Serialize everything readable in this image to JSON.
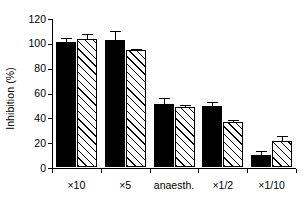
{
  "chart_data": {
    "type": "bar",
    "title": "",
    "xlabel": "",
    "ylabel": "Inhibition (%)",
    "ylim": [
      0,
      120
    ],
    "yticks": [
      0,
      20,
      40,
      60,
      80,
      100,
      120
    ],
    "ytick_labels": [
      "0",
      "20",
      "40",
      "60",
      "80",
      "100",
      "120"
    ],
    "grid": false,
    "legend": "none",
    "categories": [
      "×10",
      "×5",
      "anaesth.",
      "×1/2",
      "×1/10"
    ],
    "series": [
      {
        "name": "solid",
        "fill": "solid-black",
        "values": [
          101,
          102,
          51,
          49.5,
          9.5
        ],
        "errors": [
          4,
          8,
          5,
          4,
          4
        ]
      },
      {
        "name": "hatched",
        "fill": "diagonal-hatch",
        "values": [
          103,
          94,
          48,
          36,
          21
        ],
        "errors": [
          5,
          2,
          3,
          2.5,
          5
        ]
      }
    ]
  },
  "axes": {
    "y_title": "Inhibition (%)"
  }
}
